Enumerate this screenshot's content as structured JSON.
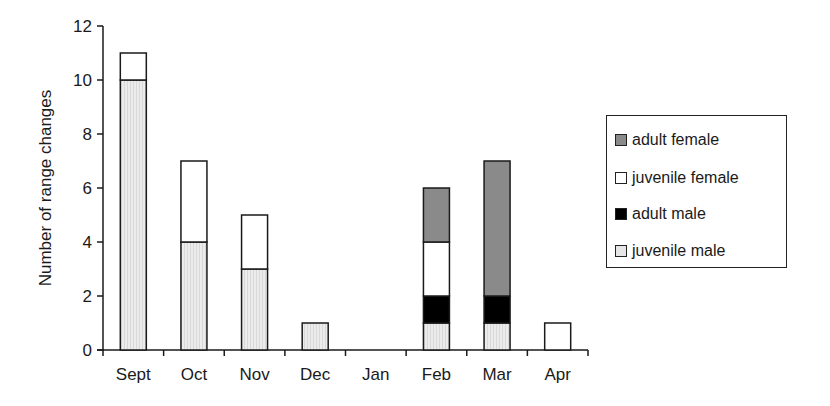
{
  "chart_data": {
    "type": "bar",
    "stacked": true,
    "title": "",
    "xlabel": "",
    "ylabel": "Number of range changes",
    "ylim": [
      0,
      12
    ],
    "yticks": [
      0,
      2,
      4,
      6,
      8,
      10,
      12
    ],
    "grid": false,
    "legend_position": "right",
    "categories": [
      "Sept",
      "Oct",
      "Nov",
      "Dec",
      "Jan",
      "Feb",
      "Mar",
      "Apr"
    ],
    "series": [
      {
        "name": "juvenile male",
        "color": "#e6e6e6",
        "values": [
          10,
          4,
          3,
          1,
          0,
          1,
          1,
          0
        ]
      },
      {
        "name": "adult male",
        "color": "#000000",
        "values": [
          0,
          0,
          0,
          0,
          0,
          1,
          1,
          0
        ]
      },
      {
        "name": "juvenile female",
        "color": "#ffffff",
        "values": [
          1,
          3,
          2,
          0,
          0,
          2,
          0,
          1
        ]
      },
      {
        "name": "adult female",
        "color": "#8a8a8a",
        "values": [
          0,
          0,
          0,
          0,
          0,
          2,
          5,
          0
        ]
      }
    ]
  },
  "legend": {
    "items": [
      {
        "label": "adult female",
        "color": "#8a8a8a"
      },
      {
        "label": "juvenile female",
        "color": "#ffffff"
      },
      {
        "label": "adult male",
        "color": "#000000"
      },
      {
        "label": "juvenile male",
        "color": "#e6e6e6"
      }
    ]
  }
}
